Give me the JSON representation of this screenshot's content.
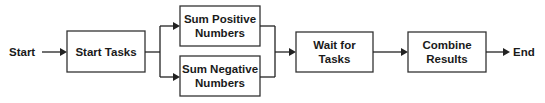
{
  "diagram": {
    "type": "flowchart",
    "direction": "left-to-right",
    "colors": {
      "stroke": "#333333",
      "text": "#1a1a1a",
      "background": "#ffffff"
    },
    "terminals": {
      "start": {
        "label": "Start"
      },
      "end": {
        "label": "End"
      }
    },
    "nodes": {
      "start_tasks": {
        "lines": [
          "Start Tasks"
        ]
      },
      "sum_positive": {
        "lines": [
          "Sum Positive",
          "Numbers"
        ]
      },
      "sum_negative": {
        "lines": [
          "Sum Negative",
          "Numbers"
        ]
      },
      "wait_tasks": {
        "lines": [
          "Wait for",
          "Tasks"
        ]
      },
      "combine_results": {
        "lines": [
          "Combine",
          "Results"
        ]
      }
    },
    "edges": [
      {
        "from": "Start",
        "to": "Start Tasks"
      },
      {
        "from": "Start Tasks",
        "to": "Sum Positive Numbers"
      },
      {
        "from": "Start Tasks",
        "to": "Sum Negative Numbers"
      },
      {
        "from": "Sum Positive Numbers",
        "to": "Wait for Tasks"
      },
      {
        "from": "Sum Negative Numbers",
        "to": "Wait for Tasks"
      },
      {
        "from": "Wait for Tasks",
        "to": "Combine Results"
      },
      {
        "from": "Combine Results",
        "to": "End"
      }
    ]
  }
}
